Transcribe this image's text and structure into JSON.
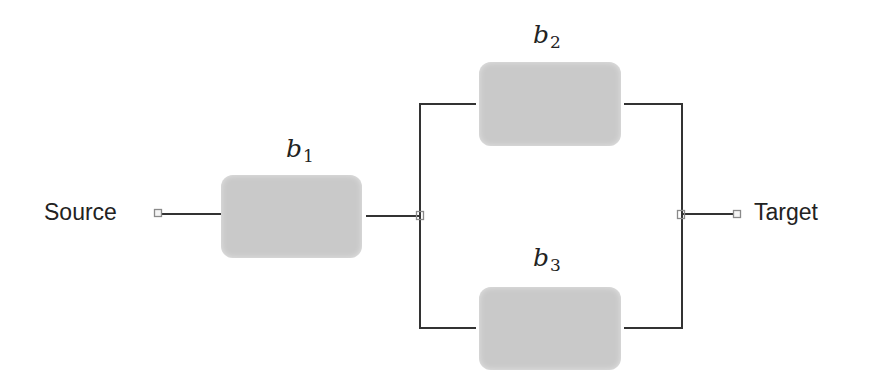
{
  "diagram": {
    "type": "reliability-block-diagram",
    "source": {
      "label": "Source"
    },
    "target": {
      "label": "Target"
    },
    "blocks": [
      {
        "id": "b1",
        "var": "b",
        "sub": "1"
      },
      {
        "id": "b2",
        "var": "b",
        "sub": "2"
      },
      {
        "id": "b3",
        "var": "b",
        "sub": "3"
      }
    ],
    "edges": [
      {
        "from": "Source",
        "to": "b1"
      },
      {
        "from": "b1",
        "to": "b2"
      },
      {
        "from": "b1",
        "to": "b3"
      },
      {
        "from": "b2",
        "to": "Target"
      },
      {
        "from": "b3",
        "to": "Target"
      }
    ],
    "colors": {
      "block_fill": "#c9c9c9",
      "line": "#333333",
      "connector": "#8a8a8a",
      "text": "#222222"
    }
  }
}
